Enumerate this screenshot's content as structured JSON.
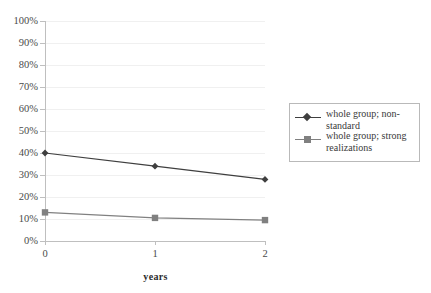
{
  "chart_data": {
    "type": "line",
    "title": "",
    "subtitle": "",
    "xlabel": "years",
    "ylabel": "",
    "x": [
      0,
      1,
      2
    ],
    "xtick_labels": [
      "0",
      "1",
      "2"
    ],
    "ylim": [
      0,
      100
    ],
    "ytick_labels": [
      "0%",
      "10%",
      "20%",
      "30%",
      "40%",
      "50%",
      "60%",
      "70%",
      "80%",
      "90%",
      "100%"
    ],
    "ytick_values": [
      0,
      10,
      20,
      30,
      40,
      50,
      60,
      70,
      80,
      90,
      100
    ],
    "grid": "horizontal",
    "legend_position": "right",
    "series": [
      {
        "name": "whole group; non-standard",
        "values": [
          40,
          34,
          28
        ],
        "color": "#3f3f3f",
        "marker": "diamond"
      },
      {
        "name": "whole group; strong realizations",
        "values": [
          13,
          10.5,
          9.5
        ],
        "color": "#808080",
        "marker": "square"
      }
    ]
  },
  "legend": {
    "entries": [
      {
        "label": "whole group; non-standard"
      },
      {
        "label": "whole group; strong realizations"
      }
    ]
  },
  "colors": {
    "series_1": "#3f3f3f",
    "series_2": "#808080",
    "axis": "#bfbfbf",
    "gridline": "#f0f0f0",
    "text": "#3a3a3a",
    "legend_border": "#b9b9b9",
    "background": "#ffffff"
  }
}
